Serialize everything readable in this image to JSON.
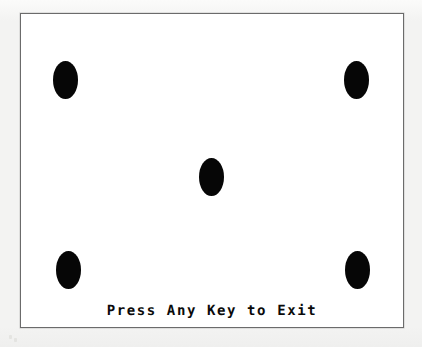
{
  "screen": {
    "width": 422,
    "height": 347,
    "background_color": "#f4f4f3",
    "panel_background_color": "#ffffff",
    "panel_border_color": "#6b6b6b"
  },
  "panel": {
    "name": "program-panel",
    "x": 20,
    "y": 13,
    "width": 384,
    "height": 315
  },
  "prompt": {
    "text": "Press Any Key to Exit",
    "color": "#0a0a0a"
  },
  "dots": {
    "color": "#060606",
    "count": 5,
    "pattern": "dice-five",
    "items": [
      {
        "label": "top-left",
        "x": 52,
        "y": 60,
        "width": 25,
        "height": 38
      },
      {
        "label": "top-right",
        "x": 343,
        "y": 60,
        "width": 25,
        "height": 38
      },
      {
        "label": "center",
        "x": 198,
        "y": 157,
        "width": 25,
        "height": 38
      },
      {
        "label": "bottom-left",
        "x": 55,
        "y": 250,
        "width": 25,
        "height": 38
      },
      {
        "label": "bottom-right",
        "x": 344,
        "y": 250,
        "width": 25,
        "height": 38
      }
    ]
  },
  "speckles": [
    {
      "x": 14,
      "y": 338
    },
    {
      "x": 9,
      "y": 335
    }
  ]
}
